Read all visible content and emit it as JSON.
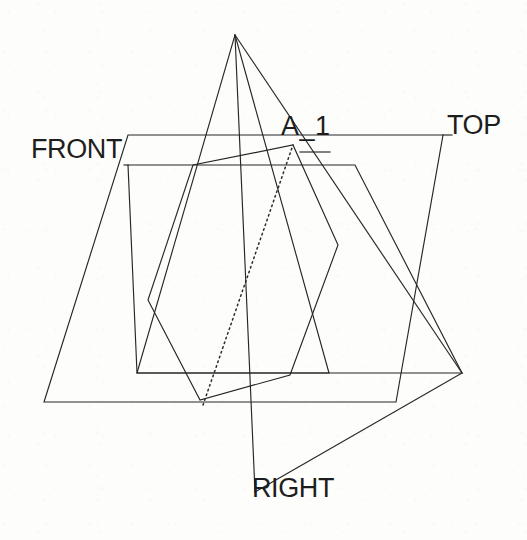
{
  "drawing": {
    "title": "Glass box projection planes with fold lines",
    "canvas": {
      "width": 527,
      "height": 540
    },
    "background_color": "#fdfdfc",
    "line_color": "#262626",
    "label_color": "#1d1d1d",
    "labels": {
      "front": "FRONT",
      "top": "TOP",
      "right": "RIGHT",
      "axis": "A_1"
    },
    "geometry": {
      "top_plane": {
        "name": "top-projection-plane",
        "points": "128,135 443,135 396,402 44,402",
        "closed": true
      },
      "front_plane": {
        "name": "front-projection-plane",
        "points": "128,165 355,165 462,373 137,373",
        "closed": true
      },
      "right_triangle_up": {
        "name": "upward-projection-triangle",
        "points": "235,35 329,373 137,373",
        "closed": true
      },
      "right_triangle_down": {
        "name": "downward-projection-triangle",
        "points": "235,35 462,373 255,492",
        "closed": false
      },
      "inner_hexagon": {
        "name": "intersection-hexagon",
        "points": "148,300 193,165 293,145 338,245 290,375 200,400",
        "closed": true
      },
      "hidden_edge": {
        "name": "hidden-edge-dotted",
        "points": "203,405 293,145"
      },
      "leaders": [
        {
          "name": "front-leader-line",
          "points": "124,164 247,164"
        },
        {
          "name": "top-leader-line",
          "points": "232,135 443,135"
        },
        {
          "name": "axis-leader-right",
          "points": "345,135 443,135"
        },
        {
          "name": "right-leader-line",
          "points": "255,492 200,430"
        }
      ]
    }
  }
}
